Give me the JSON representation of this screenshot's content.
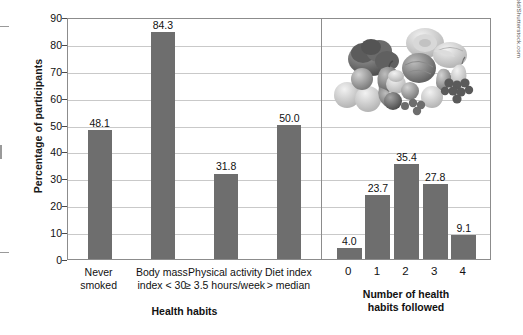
{
  "chart_data": [
    {
      "type": "bar",
      "panel": "left",
      "title": "",
      "xlabel": "Health habits",
      "ylabel": "Percentage of participants",
      "ylim": [
        0,
        90
      ],
      "yticks": [
        0,
        10,
        20,
        30,
        40,
        50,
        60,
        70,
        80,
        90
      ],
      "grid": true,
      "legend": "none",
      "categories": [
        "Never smoked",
        "Body mass index < 30",
        "Physical activity ≥ 3.5 hours/week",
        "Diet index > median"
      ],
      "category_lines": [
        [
          "Never",
          "smoked"
        ],
        [
          "Body mass",
          "index < 30"
        ],
        [
          "Physical activity",
          "≥ 3.5 hours/week"
        ],
        [
          "Diet index",
          "> median"
        ]
      ],
      "values": [
        48.1,
        84.3,
        31.8,
        50.0
      ],
      "value_labels": [
        "48.1",
        "84.3",
        "31.8",
        "50.0"
      ],
      "bar_color": "#6e6e6e"
    },
    {
      "type": "bar",
      "panel": "right",
      "title": "",
      "xlabel": "Number of health habits followed",
      "xlabel_lines": [
        "Number of health",
        "habits followed"
      ],
      "ylabel": "Percentage of participants",
      "ylim": [
        0,
        90
      ],
      "yticks": [
        0,
        10,
        20,
        30,
        40,
        50,
        60,
        70,
        80,
        90
      ],
      "grid": true,
      "legend": "none",
      "categories": [
        "0",
        "1",
        "2",
        "3",
        "4"
      ],
      "values": [
        4.0,
        23.7,
        35.4,
        27.8,
        9.1
      ],
      "value_labels": [
        "4.0",
        "23.7",
        "35.4",
        "27.8",
        "9.1"
      ],
      "bar_color": "#6e6e6e"
    }
  ],
  "axis": {
    "ylabel": "Percentage of participants",
    "yticks": [
      "90",
      "80",
      "70",
      "60",
      "50",
      "40",
      "30",
      "20",
      "10",
      "0"
    ],
    "left_xtitle": "Health habits",
    "right_xtitle_line1": "Number of health",
    "right_xtitle_line2": "habits followed"
  },
  "photo": {
    "alt": "fruits-and-vegetables-photo"
  },
  "credit": {
    "text": "Illustration © Cengage Learning®; photo: Julien Rivagnold/Shutterstock.com"
  },
  "colors": {
    "bar": "#6e6e6e",
    "grid": "#c9c9c9",
    "frame": "#8c8c8c"
  }
}
